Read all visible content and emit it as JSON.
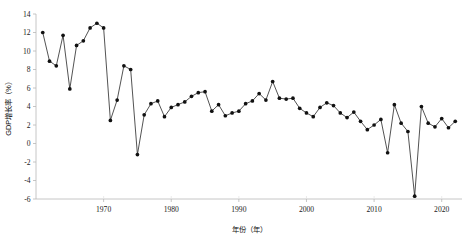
{
  "chart_data": {
    "type": "line",
    "title": "",
    "xlabel": "年份（年）",
    "ylabel": "GDP增长率（%）",
    "xlim": [
      1960,
      2023
    ],
    "ylim": [
      -6,
      14
    ],
    "grid": false,
    "legend": null,
    "marker": "filled-circle",
    "line_color": "#1a1a1a",
    "xticks": [
      1970,
      1980,
      1990,
      2000,
      2010,
      2020
    ],
    "xtick_labels": [
      "1970",
      "1980",
      "1990",
      "2000",
      "2010",
      "2020"
    ],
    "yticks": [
      -6,
      -4,
      -2,
      0,
      2,
      4,
      6,
      8,
      10,
      12,
      14
    ],
    "ytick_labels": [
      "-6",
      "-4",
      "-2",
      "0",
      "2",
      "4",
      "6",
      "8",
      "10",
      "12",
      "14"
    ],
    "x": [
      1961,
      1962,
      1963,
      1964,
      1965,
      1966,
      1967,
      1968,
      1969,
      1970,
      1971,
      1972,
      1973,
      1974,
      1975,
      1976,
      1977,
      1978,
      1979,
      1980,
      1981,
      1982,
      1983,
      1984,
      1985,
      1986,
      1987,
      1988,
      1989,
      1990,
      1991,
      1992,
      1993,
      1994,
      1995,
      1996,
      1997,
      1998,
      1999,
      2000,
      2001,
      2002,
      2003,
      2004,
      2005,
      2006,
      2007,
      2008,
      2009,
      2010,
      2011,
      2012,
      2013,
      2014,
      2015,
      2016,
      2017,
      2018,
      2019,
      2020,
      2021,
      2022
    ],
    "values": [
      12.0,
      8.9,
      8.4,
      11.7,
      5.9,
      10.6,
      11.1,
      12.5,
      13.0,
      12.5,
      2.5,
      4.7,
      8.4,
      8.0,
      -1.2,
      3.1,
      4.3,
      4.6,
      2.9,
      3.9,
      4.2,
      4.5,
      5.1,
      5.5,
      5.6,
      3.5,
      4.2,
      3.0,
      3.3,
      3.5,
      4.3,
      4.6,
      5.4,
      4.7,
      6.7,
      4.9,
      4.8,
      4.9,
      3.8,
      3.3,
      2.9,
      3.9,
      4.4,
      4.1,
      3.3,
      2.8,
      3.4,
      2.4,
      1.5,
      2.0,
      2.6,
      -1.0,
      4.2,
      2.2,
      1.3,
      -5.7,
      4.0,
      2.2,
      1.8,
      2.7,
      1.7,
      2.4
    ],
    "annotations": []
  },
  "axes": {
    "y_axis_title": "GDP增长率（%）",
    "x_axis_title": "年份（年）"
  },
  "caption": {
    "partial_bottom_text": ""
  }
}
